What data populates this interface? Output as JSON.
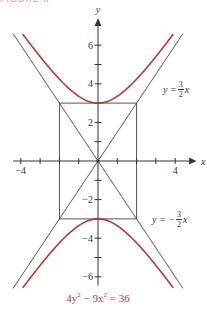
{
  "header": {
    "text": "FIGURE 8"
  },
  "chart_data": {
    "type": "line",
    "title": "",
    "caption": "4y² − 9x² = 36",
    "equation": "4y^2 - 9x^2 = 36",
    "xlabel": "x",
    "ylabel": "y",
    "xlim": [
      -4.4,
      4.8
    ],
    "ylim": [
      -6.4,
      7.2
    ],
    "x_ticks": [
      -4,
      -3,
      -2,
      -1,
      1,
      2,
      3,
      4
    ],
    "x_tick_labels": {
      "-4": "−4",
      "4": "4"
    },
    "y_ticks": [
      -6,
      -5,
      -4,
      -3,
      -2,
      -1,
      1,
      2,
      3,
      4,
      5,
      6
    ],
    "y_tick_labels": {
      "6": "6",
      "4": "4",
      "2": "2",
      "-2": "−2",
      "-4": "−4",
      "-6": "−6"
    },
    "grid": false,
    "series": [
      {
        "name": "hyperbola upper branch",
        "color": "#b23a3a",
        "formula": "y = sqrt(9 + 2.25x^2)",
        "vertex": [
          0,
          3
        ]
      },
      {
        "name": "hyperbola lower branch",
        "color": "#b23a3a",
        "formula": "y = -sqrt(9 + 2.25x^2)",
        "vertex": [
          0,
          -3
        ]
      },
      {
        "name": "asymptote",
        "color": "#444444",
        "formula": "y = 3/2 x",
        "label": "y = 3/2 x"
      },
      {
        "name": "asymptote",
        "color": "#444444",
        "formula": "y = -3/2 x",
        "label": "y = −3/2 x"
      }
    ],
    "central_box": {
      "x": [
        -2,
        2
      ],
      "y": [
        -3,
        3
      ],
      "color": "#444444"
    },
    "annotations": [
      {
        "text": "y = 3/2 x",
        "position": "upper right"
      },
      {
        "text": "y = −3/2 x",
        "position": "lower right"
      }
    ]
  },
  "labels": {
    "x_axis": "x",
    "y_axis": "y",
    "asym_pos_lhs": "y =",
    "asym_neg_lhs": "y = −",
    "frac_num": "3",
    "frac_den": "2",
    "frac_var": "x",
    "caption_parts": {
      "a": "4y",
      "b": "2",
      "c": " − 9x",
      "d": "2",
      "e": " = 36"
    }
  }
}
